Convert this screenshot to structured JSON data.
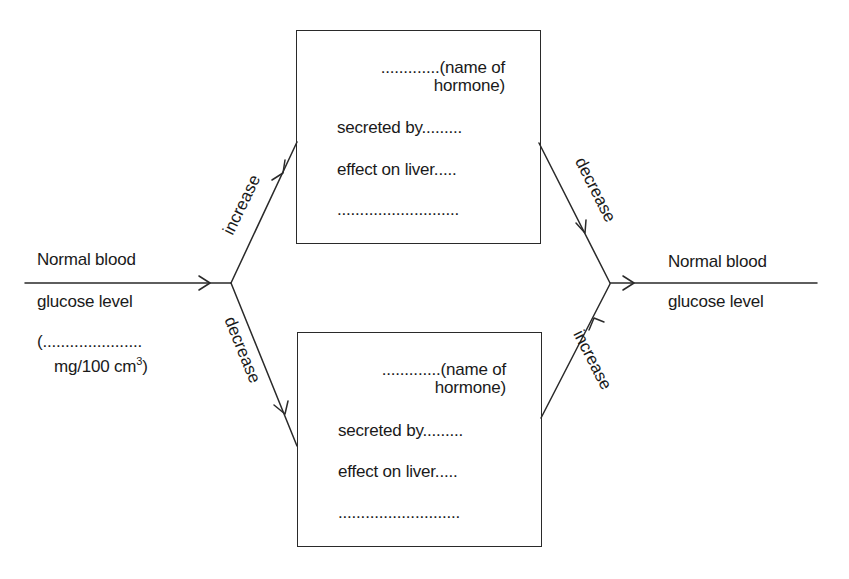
{
  "diagram": {
    "left_label": {
      "line1": "Normal blood",
      "line2": "glucose level",
      "line3": "(......................",
      "line4_prefix": "mg/100 cm",
      "line4_sup": "3",
      "line4_suffix": ")"
    },
    "right_label": {
      "line1": "Normal blood",
      "line2": "glucose level"
    },
    "arrows": {
      "left_upper": "increase",
      "left_lower": "decrease",
      "right_upper": "decrease",
      "right_lower": "increase"
    },
    "top_box": {
      "hormone_line1": ".............(name of",
      "hormone_line2": "hormone)",
      "secreted_by": "secreted by.........",
      "effect_on_liver": "effect on liver.....",
      "blank": "..........................."
    },
    "bottom_box": {
      "hormone_line1": ".............(name of",
      "hormone_line2": "hormone)",
      "secreted_by": "secreted by.........",
      "effect_on_liver": "effect on liver.....",
      "blank": "..........................."
    },
    "colors": {
      "ink": "#1a1a1a",
      "background": "#ffffff"
    }
  }
}
